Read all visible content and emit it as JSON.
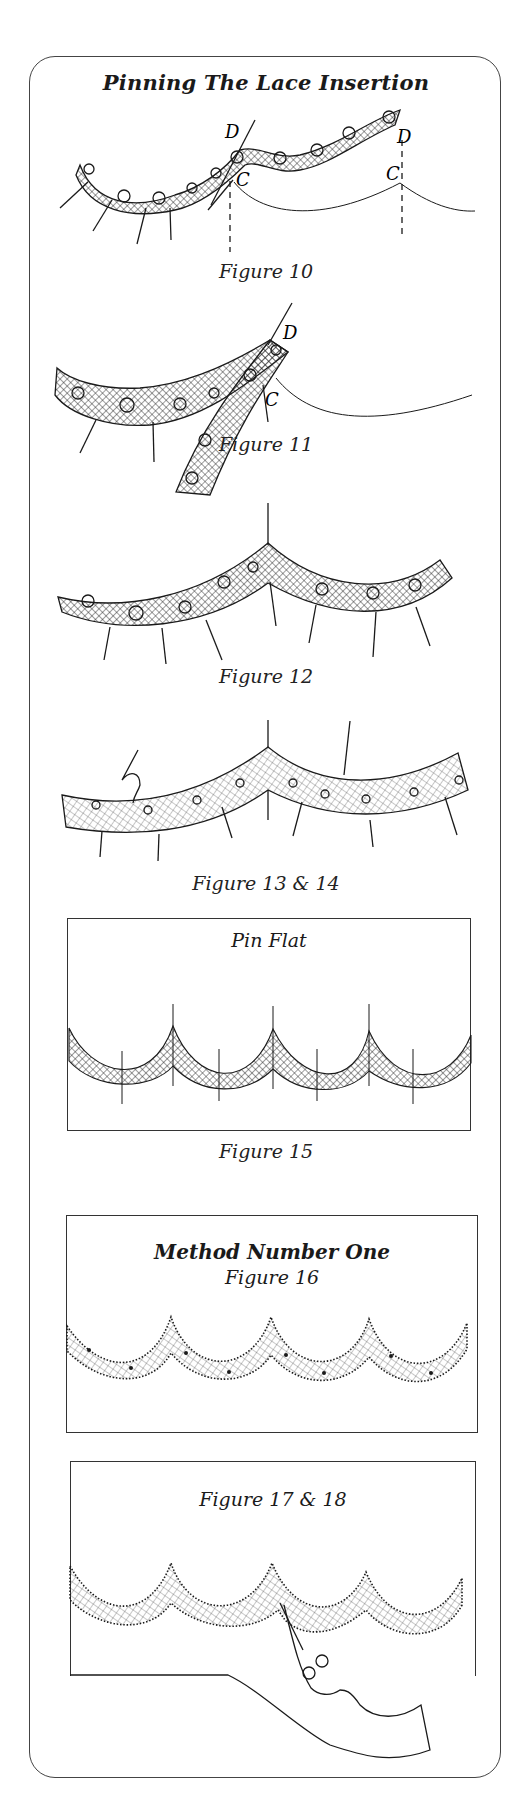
{
  "page": {
    "title": "Pinning The Lace Insertion",
    "figures": [
      {
        "caption": "Figure 10",
        "labels": [
          "D",
          "C",
          "D",
          "C"
        ]
      },
      {
        "caption": "Figure 11",
        "labels": [
          "D",
          "C"
        ]
      },
      {
        "caption": "Figure 12"
      },
      {
        "caption": "Figure 13 & 14"
      },
      {
        "box_label": "Pin Flat",
        "caption": "Figure 15"
      },
      {
        "box_heading": "Method Number One",
        "box_label": "Figure 16"
      },
      {
        "box_label": "Figure 17 & 18"
      }
    ]
  },
  "colors": {
    "ink": "#1a1a1a",
    "background": "#ffffff",
    "frame": "#444444"
  }
}
